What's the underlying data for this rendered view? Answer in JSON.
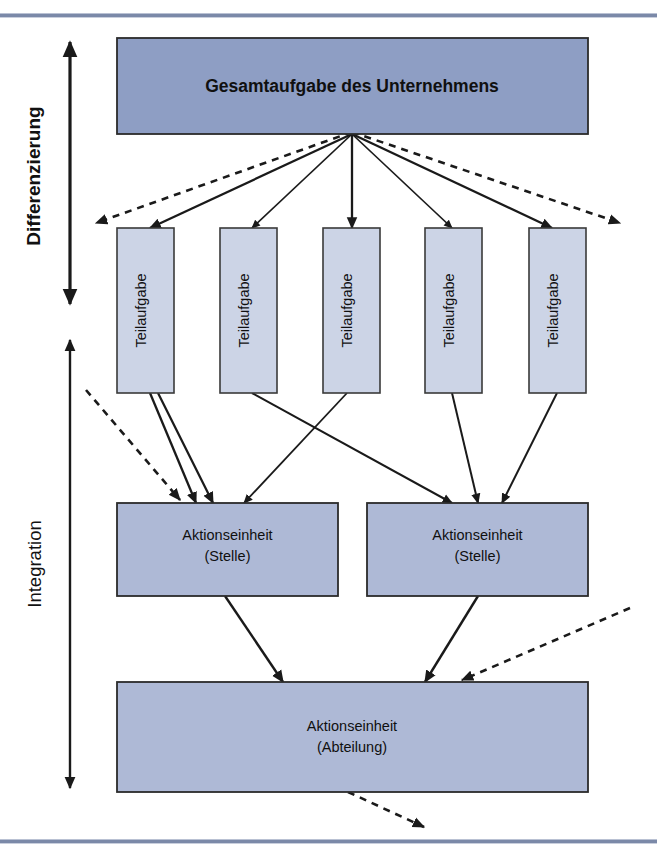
{
  "figure": {
    "title_visible": false,
    "top_rule_color": "#7b89a8",
    "bottom_rule_color": "#7b89a8"
  },
  "axes": [
    {
      "name": "differenzierung",
      "label": "Differenzierung",
      "orientation": "vertical",
      "arrowheads": "both",
      "span_px": [
        30,
        305
      ]
    },
    {
      "name": "integration",
      "label": "Integration",
      "orientation": "vertical",
      "arrowheads": "both",
      "span_px": [
        338,
        790
      ]
    }
  ],
  "nodes": {
    "gesamtaufgabe": {
      "label": "Gesamtaufgabe des Unternehmens",
      "fill": "#8e9ec4",
      "stroke": "#2b2b2b",
      "level": 1
    },
    "teilaufgaben": [
      {
        "label": "Teilaufgabe",
        "fill": "#ccd4e6",
        "stroke": "#3a3a3a"
      },
      {
        "label": "Teilaufgabe",
        "fill": "#ccd4e6",
        "stroke": "#3a3a3a"
      },
      {
        "label": "Teilaufgabe",
        "fill": "#ccd4e6",
        "stroke": "#3a3a3a"
      },
      {
        "label": "Teilaufgabe",
        "fill": "#ccd4e6",
        "stroke": "#3a3a3a"
      },
      {
        "label": "Teilaufgabe",
        "fill": "#ccd4e6",
        "stroke": "#3a3a3a"
      }
    ],
    "stellen": [
      {
        "label_line1": "Aktionseinheit",
        "label_line2": "(Stelle)",
        "fill": "#aeb9d6",
        "stroke": "#2b2b2b"
      },
      {
        "label_line1": "Aktionseinheit",
        "label_line2": "(Stelle)",
        "fill": "#aeb9d6",
        "stroke": "#2b2b2b"
      }
    ],
    "abteilung": {
      "label_line1": "Aktionseinheit",
      "label_line2": "(Abteilung)",
      "fill": "#aeb9d6",
      "stroke": "#2b2b2b"
    }
  },
  "edges": {
    "solid_count": 12,
    "dashed_count": 4,
    "description": "solid arrows from Gesamtaufgabe to five Teilaufgaben; solid arrows from Teilaufgaben to two Aktionseinheit (Stelle) boxes with crossing; solid arrows from both Stelle boxes to Aktionseinheit (Abteilung); dashed arrows indicate continuation beyond the displayed structure"
  }
}
